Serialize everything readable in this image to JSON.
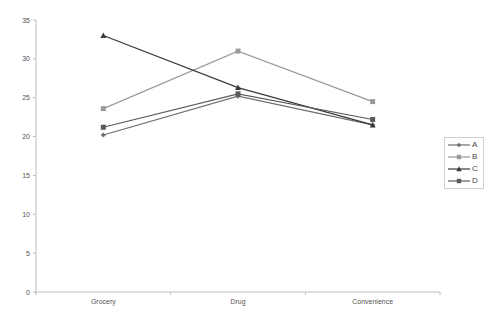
{
  "chart_data": {
    "type": "line",
    "title": "",
    "xlabel": "",
    "ylabel": "",
    "categories": [
      "Grocery",
      "Drug",
      "Convenience"
    ],
    "ylim": [
      0,
      35
    ],
    "yticks": [
      0,
      5,
      10,
      15,
      20,
      25,
      30,
      35
    ],
    "grid": false,
    "legend_position": "right",
    "series": [
      {
        "name": "A",
        "marker": "diamond",
        "color": "#6e6e6e",
        "values": [
          20.2,
          25.2,
          21.5
        ]
      },
      {
        "name": "B",
        "marker": "square",
        "color": "#9a9a9a",
        "values": [
          23.6,
          31.0,
          24.5
        ]
      },
      {
        "name": "C",
        "marker": "triangle",
        "color": "#3a3a3a",
        "values": [
          33.0,
          26.3,
          21.5
        ]
      },
      {
        "name": "D",
        "marker": "square",
        "color": "#5a5a5a",
        "values": [
          21.2,
          25.5,
          22.2
        ]
      }
    ]
  }
}
